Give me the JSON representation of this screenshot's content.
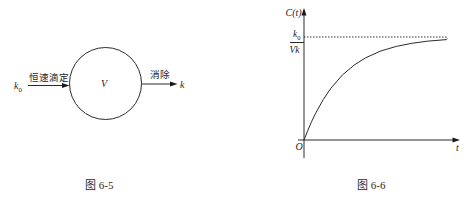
{
  "figure_6_5": {
    "caption": "图 6-5",
    "compartment_label": "V",
    "input": {
      "symbol": "k",
      "subscript": "0",
      "label": "恒速滴定"
    },
    "output": {
      "label": "消除",
      "symbol": "k"
    }
  },
  "figure_6_6": {
    "caption": "图 6-6",
    "y_axis_label": "C(t)",
    "x_axis_label": "t",
    "origin_label": "O",
    "asymptote_label": {
      "numerator_symbol": "k",
      "numerator_subscript": "0",
      "denominator": "Vk"
    }
  },
  "chart_data": {
    "type": "line",
    "title": "图 6-6",
    "xlabel": "t",
    "ylabel": "C(t)",
    "grid": false,
    "legend": null,
    "asymptote": {
      "y": 1.0,
      "label": "k0/Vk",
      "style": "dotted"
    },
    "x_units": "multiples of 1/k (no tick labels shown)",
    "y_units": "fraction of k0/Vk (no tick labels shown)",
    "series": [
      {
        "name": "C(t)",
        "x": [
          0,
          0.1,
          0.2,
          0.3,
          0.5,
          0.7,
          1.0,
          1.3,
          1.6,
          2.0,
          2.4,
          2.8,
          3.2,
          3.7
        ],
        "y": [
          0,
          0.095,
          0.181,
          0.259,
          0.393,
          0.503,
          0.632,
          0.727,
          0.798,
          0.865,
          0.909,
          0.939,
          0.959,
          0.975
        ]
      }
    ],
    "xlim": [
      0,
      4.1
    ],
    "ylim": [
      0,
      1.27
    ]
  }
}
